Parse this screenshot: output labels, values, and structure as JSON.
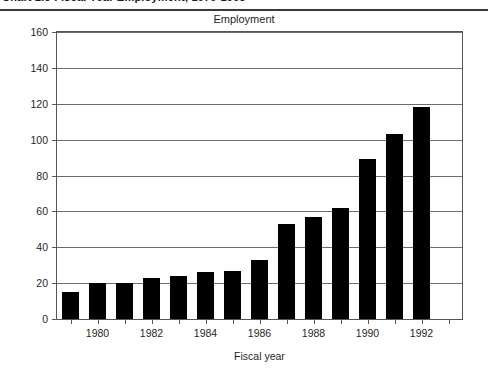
{
  "page_header": {
    "clipped_text": "Chart 2.5 Fiscal Year Employment, 1979-1993",
    "visible": true
  },
  "figure": {
    "title": "Employment",
    "xaxis_title": "Fiscal year"
  },
  "chart_data": {
    "type": "bar",
    "title": "Employment",
    "xlabel": "Fiscal year",
    "ylabel": "",
    "ylim": [
      0,
      160
    ],
    "yticks": [
      0,
      20,
      40,
      60,
      80,
      100,
      120,
      140,
      160
    ],
    "ytick_labels": [
      "0",
      "20",
      "40",
      "60",
      "80",
      "100",
      "120",
      "140",
      "160"
    ],
    "grid": true,
    "grid_axis": "y",
    "legend": false,
    "bar_color": "#000000",
    "categories": [
      "1979",
      "1980",
      "1981",
      "1982",
      "1983",
      "1984",
      "1985",
      "1986",
      "1987",
      "1988",
      "1989",
      "1990",
      "1991",
      "1992",
      "1993"
    ],
    "xtick_labels": [
      "1980",
      "1982",
      "1984",
      "1986",
      "1988",
      "1990",
      "1992"
    ],
    "values": [
      15,
      20,
      20,
      23,
      24,
      26,
      27,
      33,
      53,
      57,
      62,
      89,
      103,
      118,
      0
    ],
    "series": [
      {
        "name": "Employment",
        "values": [
          15,
          20,
          20,
          23,
          24,
          26,
          27,
          33,
          53,
          57,
          62,
          89,
          103,
          118,
          0
        ]
      }
    ]
  }
}
